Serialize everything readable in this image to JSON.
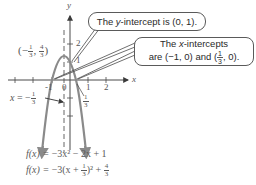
{
  "diagram": {
    "function": "f(x) = -3x^2 - 2x + 1",
    "vertex": {
      "x": "-1/3",
      "y": "4/3",
      "label_num_x": "1",
      "label_den_x": "3",
      "label_num_y": "4",
      "label_den_y": "3"
    },
    "axis_of_symmetry": {
      "label": "x = -",
      "num": "1",
      "den": "3"
    },
    "axes": {
      "x_label": "x",
      "y_label": "y"
    },
    "x_ticks": [
      "-1",
      "0",
      "1",
      "2"
    ],
    "y_ticks": [
      "1",
      "2"
    ],
    "x_intercept_tick": {
      "num": "1",
      "den": "3"
    },
    "colors": {
      "curve": "#8a8a8a",
      "axis": "#4a4a4a",
      "text": "#555555",
      "callout_border": "#5a5a5a"
    }
  },
  "callouts": {
    "y_intercept": {
      "prefix": "The ",
      "var": "y",
      "suffix": "-intercept is (0, 1)."
    },
    "x_intercepts": {
      "line1_prefix": "The ",
      "line1_var": "x",
      "line1_suffix": "-intercepts",
      "line2_prefix": "are (−1, 0) and (",
      "line2_num": "1",
      "line2_den": "3",
      "line2_suffix": ", 0)."
    }
  },
  "equations": {
    "standard": {
      "lhs": "f(x) = ",
      "rhs": "−3x² − 2x + 1"
    },
    "vertex_form": {
      "lhs": "f(x) = ",
      "a": "−3(x + ",
      "num": "1",
      "den": "3",
      "sq": ")² + ",
      "knum": "4",
      "kden": "3"
    }
  }
}
